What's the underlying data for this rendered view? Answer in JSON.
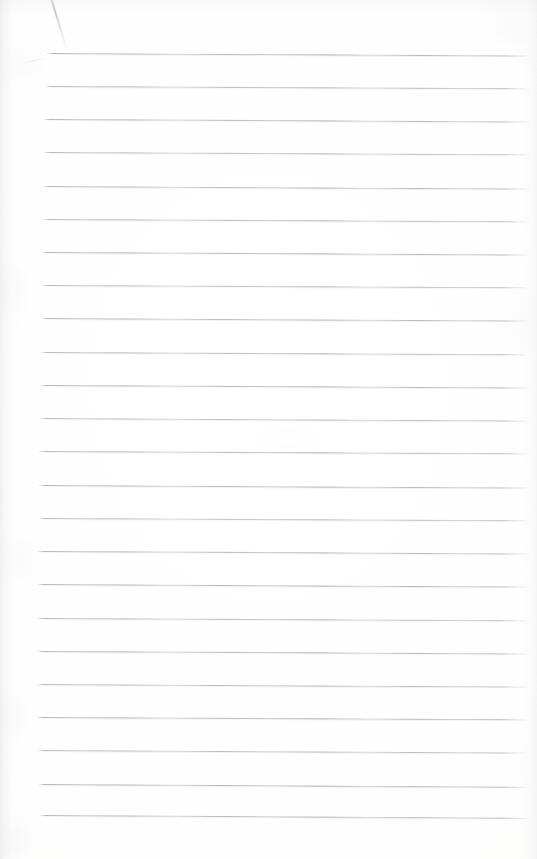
{
  "document": {
    "kind": "blank-lined-notebook-page",
    "page_width": 537,
    "page_height": 859,
    "paper_color": "#fefefe",
    "rule_color": "#969aa0",
    "has_text": false,
    "text_content": "",
    "handwriting_content": "",
    "heading": "",
    "page_number": ""
  },
  "ruling": {
    "line_count": 24,
    "first_line_y": 53,
    "line_spacing": 33.2,
    "line_thickness": 1,
    "left_margin_x": 42,
    "right_margin_x": 531,
    "slope_drop_px": 2.5,
    "lines": [
      {
        "y": 53,
        "x_start": 46,
        "x_end": 532,
        "slope": 2.6,
        "opacity": 0.92
      },
      {
        "y": 86,
        "x_start": 44,
        "x_end": 531,
        "slope": 2.4,
        "opacity": 0.88
      },
      {
        "y": 119,
        "x_start": 43,
        "x_end": 531,
        "slope": 2.5,
        "opacity": 0.9
      },
      {
        "y": 152,
        "x_start": 43,
        "x_end": 531,
        "slope": 2.3,
        "opacity": 0.86
      },
      {
        "y": 186,
        "x_start": 42,
        "x_end": 531,
        "slope": 2.6,
        "opacity": 0.91
      },
      {
        "y": 219,
        "x_start": 42,
        "x_end": 530,
        "slope": 2.4,
        "opacity": 0.87
      },
      {
        "y": 252,
        "x_start": 41,
        "x_end": 530,
        "slope": 2.5,
        "opacity": 0.93
      },
      {
        "y": 285,
        "x_start": 41,
        "x_end": 530,
        "slope": 2.3,
        "opacity": 0.85
      },
      {
        "y": 318,
        "x_start": 40,
        "x_end": 530,
        "slope": 2.6,
        "opacity": 0.9
      },
      {
        "y": 352,
        "x_start": 40,
        "x_end": 530,
        "slope": 2.4,
        "opacity": 0.88
      },
      {
        "y": 385,
        "x_start": 39,
        "x_end": 530,
        "slope": 2.5,
        "opacity": 0.92
      },
      {
        "y": 418,
        "x_start": 39,
        "x_end": 530,
        "slope": 2.7,
        "opacity": 0.86
      },
      {
        "y": 451,
        "x_start": 38,
        "x_end": 530,
        "slope": 2.4,
        "opacity": 0.89
      },
      {
        "y": 485,
        "x_start": 38,
        "x_end": 530,
        "slope": 2.6,
        "opacity": 0.91
      },
      {
        "y": 518,
        "x_start": 38,
        "x_end": 530,
        "slope": 2.3,
        "opacity": 0.84
      },
      {
        "y": 551,
        "x_start": 37,
        "x_end": 530,
        "slope": 2.5,
        "opacity": 0.9
      },
      {
        "y": 584,
        "x_start": 37,
        "x_end": 529,
        "slope": 2.6,
        "opacity": 0.93
      },
      {
        "y": 618,
        "x_start": 37,
        "x_end": 529,
        "slope": 2.4,
        "opacity": 0.87
      },
      {
        "y": 651,
        "x_start": 36,
        "x_end": 529,
        "slope": 2.5,
        "opacity": 0.91
      },
      {
        "y": 684,
        "x_start": 36,
        "x_end": 529,
        "slope": 2.7,
        "opacity": 0.88
      },
      {
        "y": 717,
        "x_start": 36,
        "x_end": 529,
        "slope": 2.4,
        "opacity": 0.92
      },
      {
        "y": 750,
        "x_start": 37,
        "x_end": 529,
        "slope": 2.6,
        "opacity": 0.86
      },
      {
        "y": 784,
        "x_start": 38,
        "x_end": 530,
        "slope": 2.8,
        "opacity": 0.94
      },
      {
        "y": 815,
        "x_start": 39,
        "x_end": 531,
        "slope": 3.0,
        "opacity": 0.9
      }
    ]
  },
  "marks": {
    "pencil_stroke_label": "faint diagonal pencil stroke near top-left corner",
    "wisp_label": "faint smudge below pencil stroke"
  },
  "artifacts": {
    "left_edge_shadow_label": "page curl shadow along left edge",
    "right_edge_shadow_label": "faint shadow along right edge",
    "top_edge_shadow_label": "faint shadow along top edge",
    "blotches": [
      {
        "x": 8,
        "y": 52,
        "w": 34,
        "h": 26,
        "alpha": 0.035
      },
      {
        "x": 2,
        "y": 268,
        "w": 26,
        "h": 46,
        "alpha": 0.03
      },
      {
        "x": 6,
        "y": 540,
        "w": 30,
        "h": 38,
        "alpha": 0.028
      },
      {
        "x": 4,
        "y": 700,
        "w": 24,
        "h": 34,
        "alpha": 0.032
      },
      {
        "x": 0,
        "y": 826,
        "w": 30,
        "h": 28,
        "alpha": 0.04
      },
      {
        "x": 490,
        "y": 10,
        "w": 46,
        "h": 34,
        "alpha": 0.03
      },
      {
        "x": 500,
        "y": 300,
        "w": 38,
        "h": 50,
        "alpha": 0.022
      },
      {
        "x": 256,
        "y": 430,
        "w": 60,
        "h": 22,
        "alpha": 0.018
      }
    ]
  }
}
